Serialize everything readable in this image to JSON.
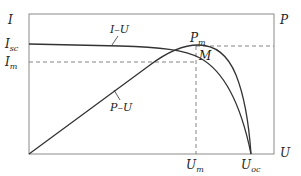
{
  "diagram": {
    "type": "solar-cell-characteristic",
    "axes": {
      "y_left_label": "I",
      "y_right_label": "P",
      "x_label": "U"
    },
    "y_ticks": [
      {
        "label": "I",
        "sub": "sc"
      },
      {
        "label": "I",
        "sub": "m"
      }
    ],
    "x_ticks": [
      {
        "label": "U",
        "sub": "m"
      },
      {
        "label": "U",
        "sub": "oc"
      }
    ],
    "curves": [
      {
        "name": "I–U",
        "label": "I–U"
      },
      {
        "name": "P–U",
        "label": "P–U"
      }
    ],
    "points": {
      "max_power": {
        "label": "P",
        "sub": "m"
      },
      "operating_point": {
        "label": "M"
      }
    },
    "colors": {
      "curve": "#333333",
      "frame": "#888888",
      "dash": "#777777"
    }
  }
}
